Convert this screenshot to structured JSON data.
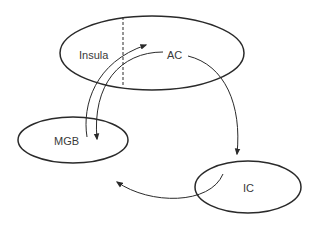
{
  "diagram": {
    "type": "auditory-pathway-loop",
    "nodes": [
      {
        "id": "insula_ac",
        "labels": [
          "Insula",
          "AC"
        ],
        "shape": "ellipse",
        "divided": true
      },
      {
        "id": "mgb",
        "label": "MGB",
        "shape": "ellipse"
      },
      {
        "id": "ic",
        "label": "IC",
        "shape": "ellipse"
      }
    ],
    "labels": {
      "insula": "Insula",
      "ac": "AC",
      "mgb": "MGB",
      "ic": "IC"
    },
    "edges": [
      {
        "from": "MGB",
        "to": "AC",
        "style": "curved-arrow"
      },
      {
        "from": "AC",
        "to": "MGB",
        "style": "curved-arrow"
      },
      {
        "from": "AC",
        "to": "IC",
        "style": "curved-arrow"
      },
      {
        "from": "IC",
        "to": "MGB",
        "style": "curved-arrow"
      }
    ],
    "colors": {
      "stroke": "#2a2a2a",
      "text": "#3a3a3a",
      "background": "#ffffff"
    }
  }
}
